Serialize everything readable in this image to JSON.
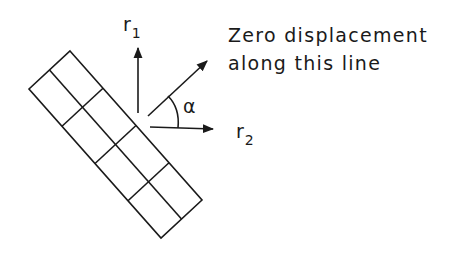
{
  "diagram": {
    "caption_line1": "Zero displacement",
    "caption_line2": "along this line",
    "labels": {
      "r1_main": "r",
      "r1_sub": "1",
      "r2_main": "r",
      "r2_sub": "2",
      "angle": "α"
    },
    "element": {
      "type": "rotated rectangular block grid",
      "rows": 4,
      "cols": 2
    },
    "arrows": [
      {
        "name": "r1",
        "direction": "up"
      },
      {
        "name": "zero-displacement-line",
        "direction": "up-right"
      },
      {
        "name": "r2",
        "direction": "right"
      }
    ],
    "colors": {
      "ink": "#1a1a1a",
      "background": "#ffffff"
    }
  }
}
